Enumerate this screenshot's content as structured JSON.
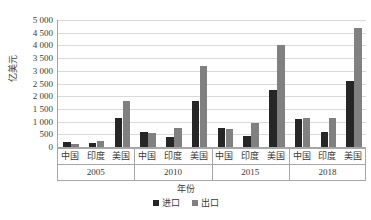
{
  "chart_data": {
    "type": "bar",
    "title": "",
    "subtitle": "",
    "xlabel": "年份",
    "ylabel": "亿美元",
    "ylim": [
      0,
      5000
    ],
    "ytick_interval": 500,
    "ytick_labels": [
      "5 000",
      "4 500",
      "4 000",
      "3 500",
      "3 000",
      "2 500",
      "2 000",
      "1 500",
      "1 000",
      "500",
      "0"
    ],
    "ytick_values": [
      5000,
      4500,
      4000,
      3500,
      3000,
      2500,
      2000,
      1500,
      1000,
      500,
      0
    ],
    "grid": true,
    "legend_position": "bottom",
    "groups": [
      "2005",
      "2010",
      "2015",
      "2018"
    ],
    "categories": [
      "中国",
      "印度",
      "美国",
      "中国",
      "印度",
      "美国",
      "中国",
      "印度",
      "美国",
      "中国",
      "印度",
      "美国"
    ],
    "series": [
      {
        "name": "进口",
        "color": "#262626",
        "values": [
          200,
          150,
          1150,
          600,
          400,
          1800,
          750,
          450,
          2250,
          1100,
          600,
          2600
        ]
      },
      {
        "name": "出口",
        "color": "#808080",
        "values": [
          100,
          250,
          1800,
          550,
          750,
          3200,
          700,
          950,
          4000,
          1150,
          1150,
          4700
        ]
      }
    ],
    "group_detail": [
      {
        "year": "2005",
        "countries": [
          {
            "label": "中国",
            "import": 200,
            "export": 100
          },
          {
            "label": "印度",
            "import": 150,
            "export": 250
          },
          {
            "label": "美国",
            "import": 1150,
            "export": 1800
          }
        ]
      },
      {
        "year": "2010",
        "countries": [
          {
            "label": "中国",
            "import": 600,
            "export": 550
          },
          {
            "label": "印度",
            "import": 400,
            "export": 750
          },
          {
            "label": "美国",
            "import": 1800,
            "export": 3200
          }
        ]
      },
      {
        "year": "2015",
        "countries": [
          {
            "label": "中国",
            "import": 750,
            "export": 700
          },
          {
            "label": "印度",
            "import": 450,
            "export": 950
          },
          {
            "label": "美国",
            "import": 2250,
            "export": 4000
          }
        ]
      },
      {
        "year": "2018",
        "countries": [
          {
            "label": "中国",
            "import": 1100,
            "export": 1150
          },
          {
            "label": "印度",
            "import": 600,
            "export": 1150
          },
          {
            "label": "美国",
            "import": 2600,
            "export": 4700
          }
        ]
      }
    ]
  },
  "legend": {
    "items": [
      {
        "label": "进口",
        "color": "#262626"
      },
      {
        "label": "出口",
        "color": "#808080"
      }
    ]
  },
  "axes": {
    "y_title": "亿美元",
    "x_title": "年份"
  }
}
